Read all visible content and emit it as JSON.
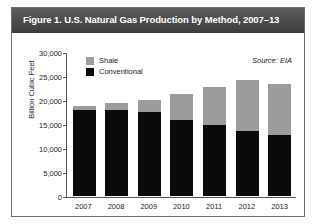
{
  "figure": {
    "title": "Figure 1. U.S. Natural Gas Production by Method, 2007–13",
    "source_note": "Source: EIA"
  },
  "legend": {
    "position": "top-left-inside",
    "items": [
      {
        "label": "Shale",
        "color": "#9c9c9c"
      },
      {
        "label": "Conventional",
        "color": "#0a0a0a"
      }
    ]
  },
  "axes": {
    "y_title": "Billion Cubic Feet",
    "y_ticks": [
      "30,000",
      "25,000",
      "20,000",
      "15,000",
      "10,000",
      "5,000",
      "0"
    ],
    "x_ticks": [
      "2007",
      "2008",
      "2009",
      "2010",
      "2011",
      "2012",
      "2013"
    ]
  },
  "chart_data": {
    "type": "bar",
    "title": "Figure 1. U.S. Natural Gas Production by Method, 2007–13",
    "subtitle": "",
    "xlabel": "",
    "ylabel": "Billion Cubic Feet",
    "categories": [
      "2007",
      "2008",
      "2009",
      "2010",
      "2011",
      "2012",
      "2013"
    ],
    "series": [
      {
        "name": "Conventional",
        "color": "#0a0a0a",
        "values": [
          18000,
          18000,
          17600,
          15900,
          15000,
          13600,
          12800
        ]
      },
      {
        "name": "Shale",
        "color": "#9c9c9c",
        "values": [
          800,
          1500,
          2600,
          5400,
          7900,
          10700,
          10600
        ]
      }
    ],
    "totals": [
      18800,
      19500,
      20200,
      21300,
      22900,
      24300,
      23400
    ],
    "stacked": true,
    "ylim": [
      0,
      30000
    ],
    "ytick_interval": 5000,
    "grid": false,
    "legend_position": "top-left-inside",
    "annotations": [
      "Source: EIA"
    ]
  }
}
